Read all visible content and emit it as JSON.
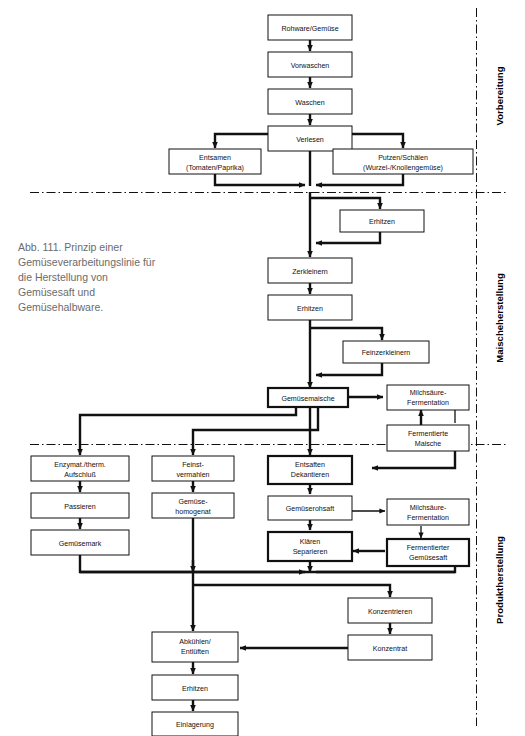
{
  "figure": {
    "caption": "Abb. 111. Prinzip einer Gemüseverarbeitungslinie für die Herstellung von Gemüsesaft und Gemüsehalbware."
  },
  "sections": [
    {
      "id": "vorbereitung",
      "label": "Vorbereitung"
    },
    {
      "id": "maischeherstellung",
      "label": "Maischeherstellung"
    },
    {
      "id": "produktherstellung",
      "label": "Produktherstellung"
    }
  ],
  "nodes": {
    "rohware": {
      "line1": "Rohware/Gemüse",
      "line2": ""
    },
    "vorwaschen": {
      "line1": "Vorwaschen",
      "line2": ""
    },
    "waschen": {
      "line1": "Waschen",
      "line2": ""
    },
    "verlesen": {
      "line1": "Verlesen",
      "line2": ""
    },
    "entsamen": {
      "line1": "Entsamen",
      "line2": "(Tomaten/Paprika)"
    },
    "putzen": {
      "line1": "Putzen/Schälen",
      "line2": "(Wurzel-/Knollengemüse)"
    },
    "erhitzen1": {
      "line1": "Erhitzen",
      "line2": ""
    },
    "zerkleinern": {
      "line1": "Zerkleinern",
      "line2": ""
    },
    "erhitzen2": {
      "line1": "Erhitzen",
      "line2": ""
    },
    "feinzerkleinern": {
      "line1": "Feinzerkleinern",
      "line2": ""
    },
    "gemuesemaische": {
      "line1": "Gemüsemaische",
      "line2": ""
    },
    "milchsaeure1": {
      "line1": "Milchsäure-",
      "line2": "Fermentation"
    },
    "fermentierte_maische": {
      "line1": "Fermentierte",
      "line2": "Maische"
    },
    "aufschluss": {
      "line1": "Enzymat./therm.",
      "line2": "Aufschluß"
    },
    "passieren": {
      "line1": "Passieren",
      "line2": ""
    },
    "gemuesemark": {
      "line1": "Gemüsemark",
      "line2": ""
    },
    "feinstvermahlen": {
      "line1": "Feinst-",
      "line2": "vermahlen"
    },
    "gemuesehomogenat": {
      "line1": "Gemüse-",
      "line2": "homogenat"
    },
    "entsaften": {
      "line1": "Entsaften",
      "line2": "Dekantieren"
    },
    "gemueserohsaft": {
      "line1": "Gemüserohsaft",
      "line2": ""
    },
    "klaeren": {
      "line1": "Klären",
      "line2": "Separieren"
    },
    "milchsaeure2": {
      "line1": "Milchsäure-",
      "line2": "Fermentation"
    },
    "fermentierter_saft": {
      "line1": "Fermentierter",
      "line2": "Gemüsesaft"
    },
    "konzentrieren": {
      "line1": "Konzentrieren",
      "line2": ""
    },
    "konzentrat": {
      "line1": "Konzentrat",
      "line2": ""
    },
    "abkuehlen": {
      "line1": "Abkühlen/",
      "line2": "Entlüften"
    },
    "erhitzen3": {
      "line1": "Erhitzen",
      "line2": ""
    },
    "einlagerung": {
      "line1": "Einlagerung",
      "line2": ""
    }
  },
  "colors": {
    "line": "#111111",
    "box_fill": "#ffffff",
    "caption_text": "#6b6b6b"
  }
}
